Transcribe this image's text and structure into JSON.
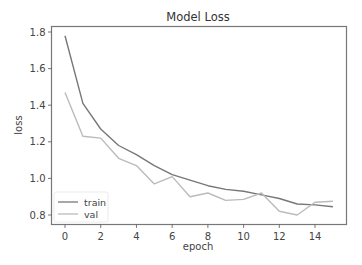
{
  "chart_data": {
    "type": "line",
    "title": "Model Loss",
    "xlabel": "epoch",
    "ylabel": "loss",
    "x": [
      0,
      1,
      2,
      3,
      4,
      5,
      6,
      7,
      8,
      9,
      10,
      11,
      12,
      13,
      14,
      15
    ],
    "series": [
      {
        "name": "train",
        "color": "#777777",
        "values": [
          1.78,
          1.41,
          1.27,
          1.18,
          1.13,
          1.07,
          1.02,
          0.99,
          0.96,
          0.94,
          0.93,
          0.91,
          0.89,
          0.86,
          0.855,
          0.845
        ]
      },
      {
        "name": "val",
        "color": "#bbbbbb",
        "values": [
          1.47,
          1.23,
          1.22,
          1.11,
          1.07,
          0.97,
          1.01,
          0.9,
          0.92,
          0.88,
          0.885,
          0.92,
          0.82,
          0.8,
          0.87,
          0.875
        ]
      }
    ],
    "xticks": [
      0,
      2,
      4,
      6,
      8,
      10,
      12,
      14
    ],
    "yticks": [
      0.8,
      1.0,
      1.2,
      1.4,
      1.6,
      1.8
    ],
    "ytick_labels": [
      "0.8",
      "1.0",
      "1.2",
      "1.4",
      "1.6",
      "1.8"
    ],
    "xlim": [
      -0.75,
      15.75
    ],
    "ylim": [
      0.757,
      1.834
    ],
    "grid": false,
    "legend_position": "lower left"
  }
}
